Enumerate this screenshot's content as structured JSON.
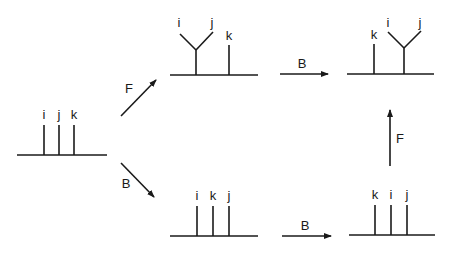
{
  "diagram": {
    "type": "tree-rotation-diagram",
    "nodes": {
      "start": {
        "labels": [
          "i",
          "j",
          "k"
        ]
      },
      "top_middle": {
        "merged_labels": [
          "i",
          "j"
        ],
        "single_label": "k"
      },
      "top_right": {
        "single_label": "k",
        "merged_labels": [
          "i",
          "j"
        ]
      },
      "bottom_middle": {
        "labels": [
          "i",
          "k",
          "j"
        ]
      },
      "bottom_right": {
        "labels": [
          "k",
          "i",
          "j"
        ]
      }
    },
    "edges": [
      {
        "from": "start",
        "to": "top_middle",
        "label": "F"
      },
      {
        "from": "start",
        "to": "bottom_middle",
        "label": "B"
      },
      {
        "from": "top_middle",
        "to": "top_right",
        "label": "B"
      },
      {
        "from": "bottom_middle",
        "to": "bottom_right",
        "label": "B"
      },
      {
        "from": "bottom_right",
        "to": "top_right",
        "label": "F"
      }
    ],
    "colors": {
      "ink": "#1a1a1a",
      "background": "#ffffff"
    }
  }
}
